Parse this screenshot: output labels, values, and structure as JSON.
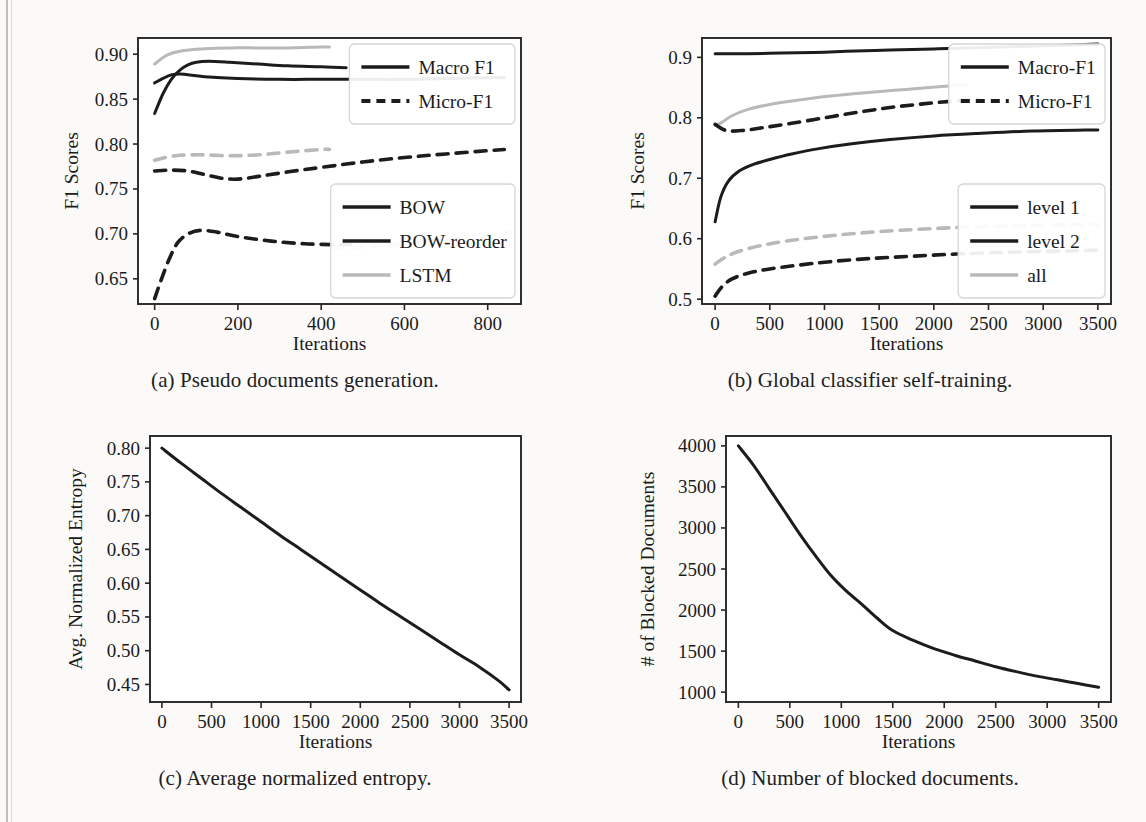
{
  "figure": {
    "panels": [
      "a",
      "b",
      "c",
      "d"
    ],
    "captions": {
      "a": "(a) Pseudo documents generation.",
      "b": "(b) Global classifier self-training.",
      "c": "(c) Average normalized entropy.",
      "d": "(d) Number of blocked documents."
    },
    "colors": {
      "dark": "#1c1c1c",
      "light_gray": "#b9b9b9",
      "axis": "#262626",
      "background": "#fbfaf8"
    }
  },
  "chart_data": [
    {
      "id": "a",
      "type": "line",
      "title": "(a) Pseudo documents generation.",
      "xlabel": "Iterations",
      "ylabel": "F1 Scores",
      "xlim": [
        -40,
        880
      ],
      "ylim": [
        0.622,
        0.918
      ],
      "xticks": [
        0,
        200,
        400,
        600,
        800
      ],
      "yticks": [
        0.65,
        0.7,
        0.75,
        0.8,
        0.85,
        0.9
      ],
      "ytick_labels": [
        "0.65",
        "0.70",
        "0.75",
        "0.80",
        "0.85",
        "0.90"
      ],
      "grid": false,
      "legends": [
        {
          "position": "upper-right",
          "entries": [
            {
              "label": "Macro  F1",
              "style": "solid",
              "color": "#1c1c1c"
            },
            {
              "label": "Micro-F1",
              "style": "dashed",
              "color": "#1c1c1c"
            }
          ]
        },
        {
          "position": "lower-right",
          "entries": [
            {
              "label": "BOW",
              "style": "solid",
              "color": "#1c1c1c"
            },
            {
              "label": "BOW-reorder",
              "style": "solid",
              "color": "#1c1c1c"
            },
            {
              "label": "LSTM",
              "style": "solid",
              "color": "#b9b9b9"
            }
          ]
        }
      ],
      "series": [
        {
          "name": "BOW Macro F1",
          "style": "solid",
          "color": "#1c1c1c",
          "x": [
            0,
            20,
            40,
            60,
            80,
            120,
            200,
            300,
            400,
            500,
            600,
            700,
            840
          ],
          "y": [
            0.868,
            0.873,
            0.877,
            0.878,
            0.877,
            0.875,
            0.873,
            0.872,
            0.872,
            0.872,
            0.872,
            0.873,
            0.874
          ]
        },
        {
          "name": "BOW-reorder Macro F1",
          "style": "solid",
          "color": "#1c1c1c",
          "x": [
            0,
            20,
            40,
            60,
            80,
            100,
            130,
            180,
            250,
            320,
            400,
            460
          ],
          "y": [
            0.834,
            0.856,
            0.872,
            0.882,
            0.888,
            0.891,
            0.892,
            0.891,
            0.889,
            0.887,
            0.886,
            0.885
          ]
        },
        {
          "name": "LSTM Macro F1",
          "style": "solid",
          "color": "#b9b9b9",
          "x": [
            0,
            30,
            70,
            120,
            180,
            250,
            320,
            400,
            420
          ],
          "y": [
            0.889,
            0.899,
            0.904,
            0.906,
            0.907,
            0.907,
            0.907,
            0.908,
            0.908
          ]
        },
        {
          "name": "BOW Micro-F1",
          "style": "dashed",
          "color": "#1c1c1c",
          "x": [
            0,
            40,
            80,
            120,
            160,
            200,
            250,
            320,
            400,
            500,
            600,
            700,
            840
          ],
          "y": [
            0.77,
            0.771,
            0.77,
            0.766,
            0.762,
            0.761,
            0.764,
            0.769,
            0.774,
            0.78,
            0.785,
            0.789,
            0.794
          ]
        },
        {
          "name": "BOW-reorder Micro-F1",
          "style": "dashed",
          "color": "#1c1c1c",
          "x": [
            0,
            15,
            35,
            55,
            80,
            110,
            150,
            200,
            280,
            360,
            440,
            470
          ],
          "y": [
            0.628,
            0.648,
            0.672,
            0.69,
            0.7,
            0.704,
            0.702,
            0.697,
            0.692,
            0.689,
            0.688,
            0.688
          ]
        },
        {
          "name": "LSTM Micro-F1",
          "style": "dashed",
          "color": "#b9b9b9",
          "x": [
            0,
            50,
            110,
            180,
            250,
            320,
            400,
            420
          ],
          "y": [
            0.782,
            0.787,
            0.788,
            0.787,
            0.788,
            0.791,
            0.794,
            0.794
          ]
        },
        {
          "name": "LSTM Micro-F1 tail",
          "style": "dashed",
          "color": "#cccccc",
          "x": [
            430,
            520,
            620,
            720,
            820,
            860
          ],
          "y": [
            0.683,
            0.686,
            0.69,
            0.695,
            0.7,
            0.702
          ]
        }
      ]
    },
    {
      "id": "b",
      "type": "line",
      "title": "(b) Global classifier self-training.",
      "xlabel": "Iterations",
      "ylabel": "F1 Scores",
      "xlim": [
        -120,
        3620
      ],
      "ylim": [
        0.492,
        0.932
      ],
      "xticks": [
        0,
        500,
        1000,
        1500,
        2000,
        2500,
        3000,
        3500
      ],
      "yticks": [
        0.5,
        0.6,
        0.7,
        0.8,
        0.9
      ],
      "ytick_labels": [
        "0.5",
        "0.6",
        "0.7",
        "0.8",
        "0.9"
      ],
      "grid": false,
      "legends": [
        {
          "position": "upper-right",
          "entries": [
            {
              "label": "Macro-F1",
              "style": "solid",
              "color": "#1c1c1c"
            },
            {
              "label": "Micro-F1",
              "style": "dashed",
              "color": "#1c1c1c"
            }
          ]
        },
        {
          "position": "lower-right",
          "entries": [
            {
              "label": "level 1",
              "style": "solid",
              "color": "#1c1c1c"
            },
            {
              "label": "level 2",
              "style": "solid",
              "color": "#1c1c1c"
            },
            {
              "label": "all",
              "style": "solid",
              "color": "#b9b9b9"
            }
          ]
        }
      ],
      "series": [
        {
          "name": "level 1 Macro-F1",
          "style": "solid",
          "color": "#1c1c1c",
          "x": [
            0,
            100,
            300,
            600,
            900,
            1200,
            1600,
            2000,
            2400,
            2800,
            3200,
            3500
          ],
          "y": [
            0.906,
            0.906,
            0.906,
            0.907,
            0.908,
            0.91,
            0.912,
            0.914,
            0.916,
            0.918,
            0.92,
            0.922
          ]
        },
        {
          "name": "level 2 Macro-F1",
          "style": "solid",
          "color": "#1c1c1c",
          "x": [
            0,
            50,
            120,
            220,
            350,
            500,
            700,
            950,
            1250,
            1600,
            2000,
            2400,
            2900,
            3500
          ],
          "y": [
            0.628,
            0.668,
            0.695,
            0.712,
            0.723,
            0.731,
            0.74,
            0.749,
            0.757,
            0.764,
            0.77,
            0.774,
            0.778,
            0.78
          ]
        },
        {
          "name": "all Macro-F1",
          "style": "solid",
          "color": "#b9b9b9",
          "x": [
            0,
            60,
            150,
            300,
            500,
            750,
            1050,
            1400,
            1750,
            2100,
            2300
          ],
          "y": [
            0.788,
            0.792,
            0.803,
            0.814,
            0.822,
            0.829,
            0.836,
            0.842,
            0.847,
            0.852,
            0.854
          ]
        },
        {
          "name": "level 1 Micro-F1",
          "style": "dashed",
          "color": "#1c1c1c",
          "x": [
            0,
            100,
            250,
            450,
            700,
            1000,
            1300,
            1600,
            1900,
            2200,
            2400
          ],
          "y": [
            0.789,
            0.779,
            0.779,
            0.784,
            0.791,
            0.8,
            0.809,
            0.817,
            0.823,
            0.828,
            0.831
          ]
        },
        {
          "name": "level 2 Micro-F1",
          "style": "dashed",
          "color": "#1c1c1c",
          "x": [
            0,
            60,
            150,
            300,
            500,
            750,
            1050,
            1400,
            1800,
            2250,
            2750,
            3300,
            3500
          ],
          "y": [
            0.505,
            0.52,
            0.533,
            0.543,
            0.55,
            0.556,
            0.562,
            0.567,
            0.571,
            0.575,
            0.578,
            0.58,
            0.581
          ]
        },
        {
          "name": "all Micro-F1",
          "style": "dashed",
          "color": "#b9b9b9",
          "x": [
            0,
            80,
            200,
            400,
            650,
            950,
            1300,
            1700,
            2150,
            2650,
            3200,
            3500
          ],
          "y": [
            0.558,
            0.568,
            0.578,
            0.588,
            0.596,
            0.603,
            0.609,
            0.614,
            0.618,
            0.621,
            0.623,
            0.624
          ]
        }
      ]
    },
    {
      "id": "c",
      "type": "line",
      "title": "(c) Average normalized entropy.",
      "xlabel": "Iterations",
      "ylabel": "Avg. Normalized Entropy",
      "xlim": [
        -120,
        3620
      ],
      "ylim": [
        0.424,
        0.818
      ],
      "xticks": [
        0,
        500,
        1000,
        1500,
        2000,
        2500,
        3000,
        3500
      ],
      "yticks": [
        0.45,
        0.5,
        0.55,
        0.6,
        0.65,
        0.7,
        0.75,
        0.8
      ],
      "ytick_labels": [
        "0.45",
        "0.50",
        "0.55",
        "0.60",
        "0.65",
        "0.70",
        "0.75",
        "0.80"
      ],
      "grid": false,
      "legends": [],
      "series": [
        {
          "name": "Avg. Normalized Entropy",
          "style": "solid",
          "color": "#1c1c1c",
          "x": [
            0,
            200,
            400,
            600,
            800,
            1000,
            1200,
            1400,
            1600,
            1800,
            2000,
            2200,
            2400,
            2600,
            2800,
            3000,
            3200,
            3400,
            3500
          ],
          "y": [
            0.8,
            0.777,
            0.755,
            0.733,
            0.712,
            0.691,
            0.67,
            0.65,
            0.63,
            0.61,
            0.59,
            0.57,
            0.551,
            0.532,
            0.513,
            0.494,
            0.476,
            0.455,
            0.442
          ]
        }
      ]
    },
    {
      "id": "d",
      "type": "line",
      "title": "(d) Number of blocked documents.",
      "xlabel": "Iterations",
      "ylabel": "# of Blocked Documents",
      "xlim": [
        -120,
        3620
      ],
      "ylim": [
        880,
        4120
      ],
      "xticks": [
        0,
        500,
        1000,
        1500,
        2000,
        2500,
        3000,
        3500
      ],
      "yticks": [
        1000,
        1500,
        2000,
        2500,
        3000,
        3500,
        4000
      ],
      "ytick_labels": [
        "1000",
        "1500",
        "2000",
        "2500",
        "3000",
        "3500",
        "4000"
      ],
      "grid": false,
      "legends": [],
      "series": [
        {
          "name": "# of Blocked Documents",
          "style": "solid",
          "color": "#1c1c1c",
          "x": [
            0,
            150,
            300,
            450,
            600,
            750,
            900,
            1050,
            1200,
            1350,
            1500,
            1700,
            1900,
            2100,
            2300,
            2500,
            2700,
            2900,
            3100,
            3300,
            3500
          ],
          "y": [
            4000,
            3760,
            3480,
            3200,
            2920,
            2660,
            2420,
            2230,
            2070,
            1900,
            1750,
            1630,
            1530,
            1450,
            1380,
            1310,
            1250,
            1195,
            1150,
            1105,
            1060
          ]
        }
      ]
    }
  ]
}
